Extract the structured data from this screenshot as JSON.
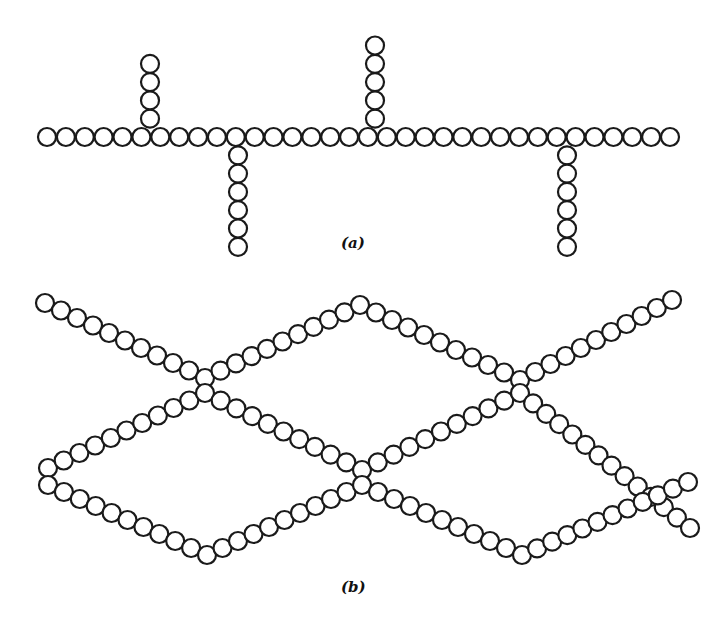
{
  "figure": {
    "panel_a": {
      "label": "(a)",
      "description": "Linear main chain with branched side chains",
      "bead_radius": 9,
      "main_chain": {
        "y": 137,
        "x_start": 47,
        "x_end": 670,
        "count": 34
      },
      "branches": [
        {
          "x": 150,
          "direction": "up",
          "count": 4
        },
        {
          "x": 375,
          "direction": "up",
          "count": 5
        },
        {
          "x": 238,
          "direction": "down",
          "count": 6
        },
        {
          "x": 567,
          "direction": "down",
          "count": 6
        }
      ]
    },
    "panel_b": {
      "label": "(b)",
      "description": "Two chains crossing to form cross-linked network",
      "bead_radius": 9,
      "chains": [
        {
          "name": "chain-upper",
          "points": [
            [
              45,
              303
            ],
            [
              205,
              378
            ],
            [
              360,
              305
            ],
            [
              520,
              380
            ],
            [
              672,
              300
            ]
          ]
        },
        {
          "name": "chain-middle",
          "points": [
            [
              48,
              468
            ],
            [
              205,
              393
            ],
            [
              362,
              470
            ],
            [
              520,
              393
            ],
            [
              690,
              528
            ]
          ]
        },
        {
          "name": "chain-lower",
          "points": [
            [
              48,
              485
            ],
            [
              207,
              555
            ],
            [
              362,
              485
            ],
            [
              522,
              555
            ],
            [
              688,
              482
            ]
          ]
        }
      ]
    },
    "colors": {
      "stroke": "#1a1a1a",
      "fill": "#ffffff",
      "background": "#ffffff"
    }
  }
}
